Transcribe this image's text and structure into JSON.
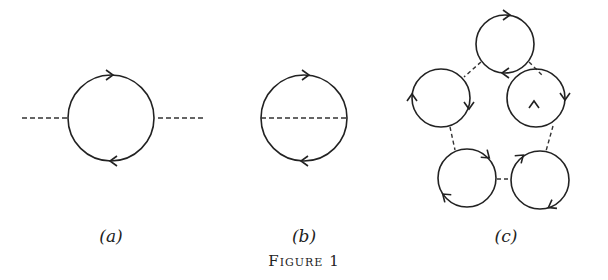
{
  "figure": {
    "caption": "Figure 1",
    "panels": [
      {
        "id": "a",
        "label": "(a)",
        "description": "Single fermion loop with two external dashed lines (self-energy bubble)"
      },
      {
        "id": "b",
        "label": "(b)",
        "description": "Fermion loop with internal dashed line across diameter"
      },
      {
        "id": "c",
        "label": "(c)",
        "description": "Ring of five fermion loops connected by dashed lines"
      }
    ]
  },
  "colors": {
    "stroke": "#222222",
    "background": "#ffffff"
  }
}
